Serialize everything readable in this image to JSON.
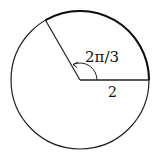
{
  "diagram": {
    "angle_label": "2π/3",
    "radius_label": "2",
    "center": [
      80,
      80
    ],
    "radius_px": 69,
    "stroke_color": "#222222",
    "background": "#ffffff"
  }
}
